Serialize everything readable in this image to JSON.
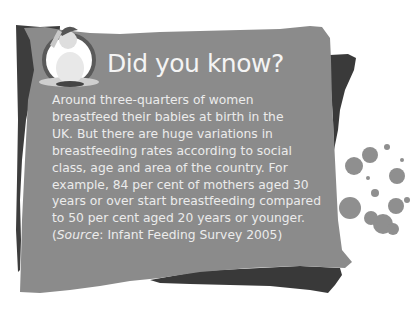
{
  "callout": {
    "title": "Did you know?",
    "lines": [
      "Around three-quarters of women",
      "breastfeed their babies at birth in the",
      "UK. But there are huge variations in",
      "breastfeeding rates according to social",
      "class, age and area of the country. For",
      "example, 84 per cent of mothers aged 30",
      "years or over start breastfeeding compared",
      "to 50 per cent aged 20 years or younger."
    ],
    "source": {
      "open": "(",
      "label": "Source",
      "rest": ": Infant Feeding Survey 2005)"
    },
    "image": "baby-photo",
    "colors": {
      "panel": "#8b8b8b",
      "shadow": "#3b3b3b",
      "text": "#ececec",
      "splatter": "#8f8f8f"
    }
  }
}
